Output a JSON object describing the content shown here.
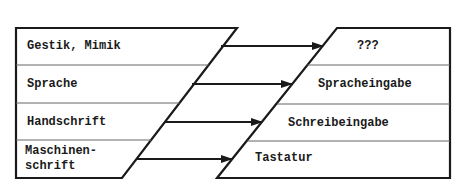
{
  "diagram": {
    "left_items": [
      {
        "label": "Gestik, Mimik"
      },
      {
        "label": "Sprache"
      },
      {
        "label": "Handschrift"
      },
      {
        "label_line1": "Maschinen-",
        "label_line2": "schrift"
      }
    ],
    "right_items": [
      {
        "label": "???"
      },
      {
        "label": "Spracheingabe"
      },
      {
        "label": "Schreibeingabe"
      },
      {
        "label": "Tastatur"
      }
    ],
    "colors": {
      "stroke": "#1a1a1a",
      "divider": "#555555",
      "background": "#ffffff"
    }
  }
}
